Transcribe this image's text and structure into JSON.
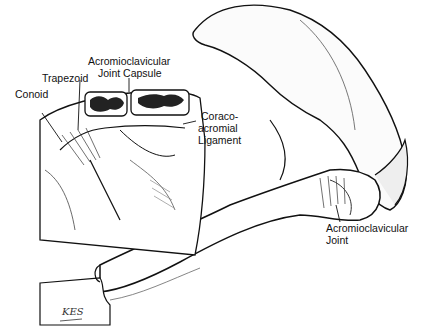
{
  "figure": {
    "labels": {
      "ac_joint_capsule_line1": "Acromioclavicular",
      "ac_joint_capsule_line2": "Joint Capsule",
      "trapezoid": "Trapezoid",
      "conoid": "Conoid",
      "coracoacromial_line1": "Coraco-",
      "coracoacromial_line2": "acromial",
      "coracoacromial_line3": "Ligament",
      "ac_joint_line1": "Acromioclavicular",
      "ac_joint_line2": "Joint"
    },
    "artist_signature": "KES"
  }
}
